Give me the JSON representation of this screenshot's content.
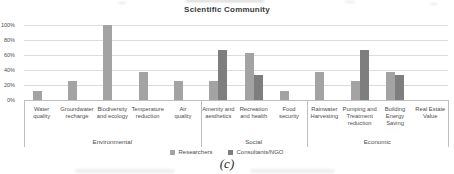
{
  "chart_data": {
    "type": "bar",
    "title": "Scientific Community",
    "xlabel": "",
    "ylabel": "",
    "ylim": [
      0,
      100
    ],
    "yticks": [
      {
        "value": 0,
        "label": "0%"
      },
      {
        "value": 20,
        "label": "20%"
      },
      {
        "value": 40,
        "label": "40%"
      },
      {
        "value": 60,
        "label": "60%"
      },
      {
        "value": 80,
        "label": "80%"
      },
      {
        "value": 100,
        "label": "100%"
      }
    ],
    "grid": "horizontal",
    "legend_position": "bottom",
    "categories": [
      "Water quality",
      "Groundwater recharge",
      "Biodiversity and ecology",
      "Temperature reduction",
      "Air quality",
      "Amenity and aesthetics",
      "Recreation and health",
      "Food security",
      "Rainwater Harvesting",
      "Pumping and Treatment reduction",
      "Building Energy Saving",
      "Real Estate Value"
    ],
    "category_lines": [
      [
        "Water",
        "quality"
      ],
      [
        "Groundwater",
        "recharge"
      ],
      [
        "Biodiversity",
        "and ecology"
      ],
      [
        "Temperature",
        "reduction"
      ],
      [
        "Air",
        "quality"
      ],
      [
        "Amenity and",
        "aesthetics"
      ],
      [
        "Recreation",
        "and health"
      ],
      [
        "Food",
        "security"
      ],
      [
        "Rainwater",
        "Harvesting"
      ],
      [
        "Pumping and",
        "Treatment",
        "reduction"
      ],
      [
        "Building",
        "Energy",
        "Saving"
      ],
      [
        "Real Estate",
        "Value"
      ]
    ],
    "groups": [
      {
        "label": "Environmental",
        "span": [
          0,
          4
        ]
      },
      {
        "label": "Social",
        "span": [
          5,
          7
        ]
      },
      {
        "label": "Economic",
        "span": [
          8,
          11
        ]
      }
    ],
    "series": [
      {
        "name": "Researchers",
        "color": "#a3a3a3",
        "values": [
          12.5,
          25,
          100,
          37.5,
          25,
          25,
          62.5,
          12.5,
          37.5,
          25,
          37.5,
          0
        ]
      },
      {
        "name": "Consultants/NGO",
        "color": "#7e7e7e",
        "values": [
          0,
          0,
          0,
          0,
          0,
          66.7,
          33.3,
          0,
          0,
          66.7,
          33.3,
          0
        ]
      }
    ],
    "caption": "(c)"
  }
}
